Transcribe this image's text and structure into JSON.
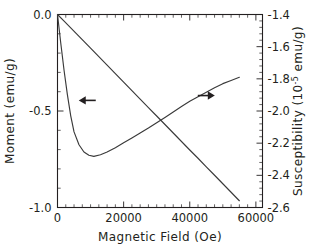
{
  "chart_data": {
    "type": "line",
    "title": "",
    "xlabel": "Magnetic Field (Oe)",
    "ylabel": "Moment (emu/g)",
    "y2label_prefix": "Susceptibility (10",
    "y2label_exponent": "-5",
    "y2label_suffix": " emu/g)",
    "xlim": [
      0,
      62000
    ],
    "ylim": [
      -1.0,
      0.0
    ],
    "y2lim": [
      -2.6,
      -1.4
    ],
    "grid": false,
    "legend": "none",
    "xticks": [
      0,
      20000,
      40000,
      60000
    ],
    "xticklabels": [
      "0",
      "20000",
      "40000",
      "60000"
    ],
    "xminor_step": 2500,
    "yticks": [
      0.0,
      -0.5,
      -1.0
    ],
    "yticklabels": [
      "0.0",
      "-0.5",
      "-1.0"
    ],
    "yminor_step": 0.1,
    "y2ticks": [
      -1.4,
      -1.6,
      -1.8,
      -2.0,
      -2.2,
      -2.4,
      -2.6
    ],
    "y2ticklabels": [
      "-1.4",
      "-1.6",
      "-1.8",
      "-2.0",
      "-2.2",
      "-2.4",
      "-2.6"
    ],
    "y2minor_step": 0.04,
    "series": [
      {
        "name": "Moment",
        "axis": "left",
        "color": "#3a3a3a",
        "annotation": "left-arrow",
        "x": [
          0,
          2000,
          4000,
          6000,
          8000,
          10000,
          12500,
          15000,
          17500,
          20000,
          22500,
          25000,
          27500,
          30000,
          32500,
          35000,
          37500,
          40000,
          42500,
          45000,
          47500,
          50000,
          52500,
          55000
        ],
        "y": [
          0.0,
          -0.034,
          -0.069,
          -0.104,
          -0.139,
          -0.174,
          -0.218,
          -0.262,
          -0.306,
          -0.35,
          -0.394,
          -0.438,
          -0.482,
          -0.526,
          -0.57,
          -0.614,
          -0.658,
          -0.702,
          -0.745,
          -0.789,
          -0.833,
          -0.877,
          -0.921,
          -0.965
        ]
      },
      {
        "name": "Susceptibility",
        "axis": "right",
        "color": "#3a3a3a",
        "annotation": "right-arrow",
        "x": [
          0,
          1000,
          2000,
          3000,
          4000,
          5000,
          6500,
          8000,
          9500,
          11000,
          13000,
          15000,
          17500,
          20000,
          22500,
          25000,
          27500,
          30000,
          32500,
          35000,
          37500,
          40000,
          42500,
          45000,
          47500,
          50000,
          52500,
          55000
        ],
        "y": [
          -1.4,
          -1.58,
          -1.75,
          -1.9,
          -2.03,
          -2.13,
          -2.21,
          -2.255,
          -2.275,
          -2.282,
          -2.272,
          -2.255,
          -2.228,
          -2.198,
          -2.168,
          -2.137,
          -2.106,
          -2.073,
          -2.04,
          -2.006,
          -1.972,
          -1.94,
          -1.912,
          -1.884,
          -1.856,
          -1.83,
          -1.81,
          -1.79
        ]
      }
    ],
    "annotations": [
      {
        "name": "left-pointing-arrow",
        "direction": "left",
        "x_data": 9000,
        "y_axis": "left",
        "y_data": -0.445,
        "meaning": "moment-curve-uses-left-axis"
      },
      {
        "name": "right-pointing-arrow",
        "direction": "right",
        "x_data": 45000,
        "y_axis": "left",
        "y_data": -0.42,
        "meaning": "susceptibility-curve-uses-right-axis"
      }
    ]
  },
  "colors": {
    "axis": "#231f20",
    "curve": "#3a3a3a",
    "background": "#ffffff"
  }
}
